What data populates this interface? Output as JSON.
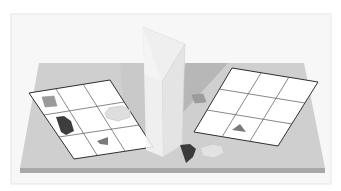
{
  "figure": {
    "colors": {
      "background": "#f7f7f7",
      "frame": "#e9e9e9",
      "tray_top": "#cdcdcd",
      "tray_front": "#a9a9a9",
      "shadow": "#b9b9b9",
      "grid_fill": "#ffffff",
      "grid_line": "#333333",
      "mirror": "#ececec",
      "shape_light": "#9a9a9a",
      "shape_dark": "#3c3c3c",
      "shape_hexagon": "#dedede",
      "shape_triangle": "#7a7a7a"
    },
    "left_grid": {
      "rows": 3,
      "cols": 3,
      "pieces": [
        {
          "name": "square",
          "row": 0,
          "col": 0,
          "shade": "light"
        },
        {
          "name": "pentagon",
          "row": 1,
          "col": 0,
          "shade": "dark"
        },
        {
          "name": "hexagon",
          "row": 1,
          "col": 2,
          "shade": "pale"
        },
        {
          "name": "triangle",
          "row": 2,
          "col": 1,
          "shade": "medium"
        }
      ]
    },
    "right_grid": {
      "rows": 3,
      "cols": 3,
      "pieces": [
        {
          "name": "triangle",
          "row": 2,
          "col": 1,
          "shade": "medium"
        }
      ]
    },
    "loose_pieces": [
      {
        "name": "square",
        "location": "behind mirror, right side"
      },
      {
        "name": "pentagon",
        "location": "front, beside mirror base"
      },
      {
        "name": "hexagon",
        "location": "front, beside mirror base"
      }
    ]
  }
}
